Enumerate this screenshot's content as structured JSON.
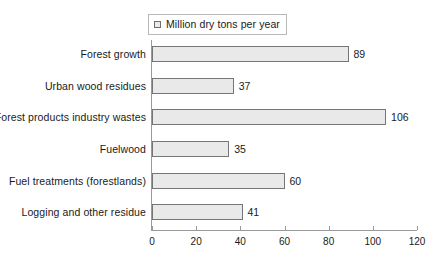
{
  "legend": {
    "marker": "square-marker-icon",
    "label": "Million dry tons per year",
    "position": "top-center"
  },
  "axis": {
    "ticks": [
      "0",
      "20",
      "40",
      "60",
      "80",
      "100",
      "120"
    ]
  },
  "chart_data": {
    "type": "bar",
    "orientation": "horizontal",
    "title": "",
    "subtitle": "",
    "xlabel": "",
    "ylabel": "",
    "categories": [
      "Forest growth",
      "Urban wood residues",
      "Forest products industry wastes",
      "Fuelwood",
      "Fuel treatments (forestlands)",
      "Logging and other residue"
    ],
    "values": [
      89,
      37,
      106,
      35,
      60,
      41
    ],
    "data_labels": [
      "89",
      "37",
      "106",
      "35",
      "60",
      "41"
    ],
    "series": [
      {
        "name": "Million dry tons per year",
        "values": [
          89,
          37,
          106,
          35,
          60,
          41
        ]
      }
    ],
    "xlim": [
      0,
      120
    ],
    "xticks": [
      0,
      20,
      40,
      60,
      80,
      100,
      120
    ],
    "grid": false,
    "legend": "top-center",
    "colors": {
      "bar_fill": "#e9e9e9",
      "bar_border": "#767676",
      "axis": "#9a9a9a",
      "text": "#1a1a1a",
      "background": "#ffffff"
    }
  }
}
